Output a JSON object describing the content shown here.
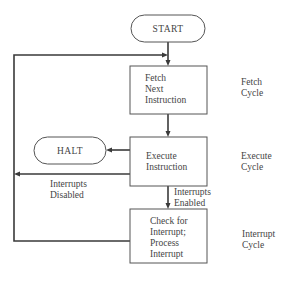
{
  "diagram": {
    "type": "flowchart",
    "nodes": {
      "start": {
        "label": "START",
        "shape": "terminator"
      },
      "fetch": {
        "lines": [
          "Fetch",
          "Next",
          "Instruction"
        ],
        "shape": "process"
      },
      "execute": {
        "lines": [
          "Execute",
          "Instruction"
        ],
        "shape": "process"
      },
      "halt": {
        "label": "HALT",
        "shape": "terminator"
      },
      "interrupt": {
        "lines": [
          "Check for",
          "Interrupt;",
          "Process",
          "Interrupt"
        ],
        "shape": "process"
      }
    },
    "edges": [
      {
        "from": "start",
        "to": "fetch",
        "label": ""
      },
      {
        "from": "fetch",
        "to": "execute",
        "label": ""
      },
      {
        "from": "execute",
        "to": "halt",
        "label": ""
      },
      {
        "from": "execute",
        "to": "fetch",
        "label_lines": [
          "Interrupts",
          "Disabled"
        ]
      },
      {
        "from": "execute",
        "to": "interrupt",
        "label_lines": [
          "Interrupts",
          "Enabled"
        ]
      },
      {
        "from": "interrupt",
        "to": "fetch",
        "label": ""
      }
    ],
    "stages": [
      {
        "lines": [
          "Fetch",
          "Cycle"
        ]
      },
      {
        "lines": [
          "Execute",
          "Cycle"
        ]
      },
      {
        "lines": [
          "Interrupt",
          "Cycle"
        ]
      }
    ]
  }
}
